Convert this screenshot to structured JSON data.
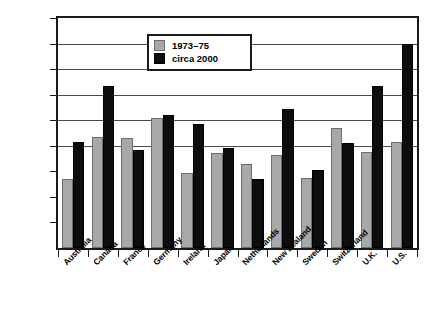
{
  "chart_data": {
    "type": "bar",
    "title": "",
    "xlabel": "",
    "ylabel": "",
    "ylim": [
      0,
      18
    ],
    "ytick_labels": [
      "2%",
      "4%",
      "6%",
      "8%",
      "10%",
      "12%",
      "14%",
      "16%",
      "18%"
    ],
    "ytick_values": [
      2,
      4,
      6,
      8,
      10,
      12,
      14,
      16,
      18
    ],
    "gridlines_at": [
      8,
      10,
      12,
      14,
      16,
      18
    ],
    "grid": true,
    "legend_position": "upper-center",
    "categories": [
      "Australia",
      "Canada",
      "France",
      "Germany",
      "Ireland",
      "Japan",
      "Netherlands",
      "New Zealand",
      "Sweden",
      "Switzerland",
      "U.K.",
      "U.S."
    ],
    "series": [
      {
        "name": "1973–75",
        "color": "#a8a8a8",
        "values": [
          5.4,
          8.7,
          8.6,
          10.2,
          5.9,
          7.4,
          6.6,
          7.3,
          5.5,
          9.4,
          7.5,
          8.3
        ]
      },
      {
        "name": "circa 2000",
        "color": "#0d0d0d",
        "values": [
          8.3,
          12.7,
          7.7,
          10.4,
          9.7,
          7.8,
          5.4,
          10.9,
          6.1,
          8.2,
          12.7,
          16.0
        ]
      }
    ]
  },
  "legend": {
    "items": [
      {
        "label": "1973–75",
        "swatch": "gray-swatch"
      },
      {
        "label": "circa 2000",
        "swatch": "black-swatch"
      }
    ]
  }
}
